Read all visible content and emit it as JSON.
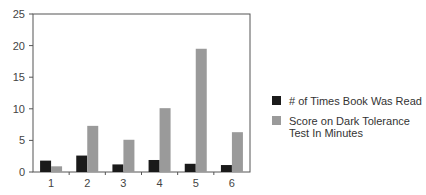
{
  "chart_data": {
    "type": "bar",
    "title": "",
    "xlabel": "",
    "ylabel": "",
    "categories": [
      "1",
      "2",
      "3",
      "4",
      "5",
      "6"
    ],
    "series": [
      {
        "name": "# of Times Book Was Read",
        "color": "#1a1a1a",
        "values": [
          1.8,
          2.6,
          1.2,
          1.9,
          1.3,
          1.1
        ]
      },
      {
        "name": "Score on Dark Tolerance Test In Minutes",
        "color": "#9a9a9a",
        "values": [
          0.9,
          7.3,
          5.1,
          10.1,
          19.5,
          6.3
        ]
      }
    ],
    "ylim": [
      0,
      25
    ],
    "yticks": [
      0,
      5,
      10,
      15,
      20,
      25
    ],
    "grid": false,
    "legend_position": "right"
  },
  "legend": {
    "items": [
      {
        "label": "# of Times Book Was Read",
        "color": "#1a1a1a"
      },
      {
        "label": "Score on Dark Tolerance Test In Minutes",
        "color": "#9a9a9a"
      }
    ]
  }
}
